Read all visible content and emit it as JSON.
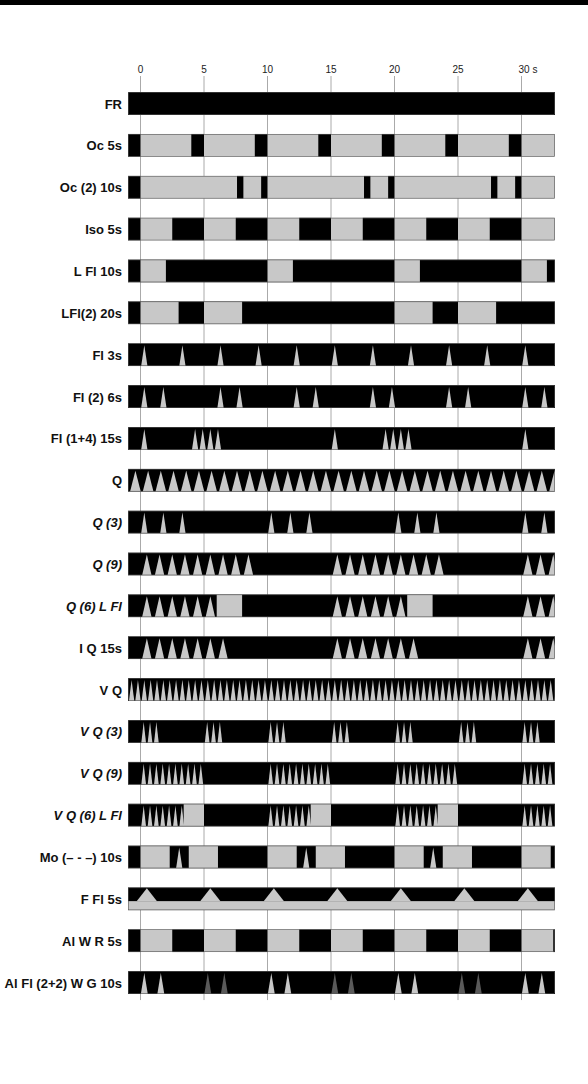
{
  "chart_data": {
    "type": "timeline",
    "title": "",
    "xlabel": "s",
    "xlim": [
      -0.95,
      32.7
    ],
    "x_ticks": [
      0,
      5,
      10,
      15,
      20,
      25,
      30
    ],
    "x_tick_labels": [
      "0",
      "5",
      "10",
      "15",
      "20",
      "25",
      "30 s"
    ],
    "colors": {
      "dark": "#000000",
      "light": "#c8c8c8",
      "dim": "#5a5a5a",
      "grid": "#aaaaaa"
    },
    "rows": [
      {
        "label": "FR",
        "italic": false,
        "base": "dark",
        "segments": [
          {
            "s": -1,
            "e": 33,
            "c": "dark"
          }
        ]
      },
      {
        "label": "Oc 5s",
        "italic": false,
        "base": "light",
        "segments": [
          {
            "s": -1,
            "e": 0,
            "c": "dark"
          },
          {
            "s": 4,
            "e": 5,
            "c": "dark"
          },
          {
            "s": 9,
            "e": 10,
            "c": "dark"
          },
          {
            "s": 14,
            "e": 15,
            "c": "dark"
          },
          {
            "s": 19,
            "e": 20,
            "c": "dark"
          },
          {
            "s": 24,
            "e": 25,
            "c": "dark"
          },
          {
            "s": 29,
            "e": 30,
            "c": "dark"
          }
        ]
      },
      {
        "label": "Oc (2) 10s",
        "italic": false,
        "base": "light",
        "segments": [
          {
            "s": -1,
            "e": 0,
            "c": "dark"
          },
          {
            "s": 7.6,
            "e": 8.1,
            "c": "dark"
          },
          {
            "s": 9.5,
            "e": 10,
            "c": "dark"
          },
          {
            "s": 17.6,
            "e": 18.1,
            "c": "dark"
          },
          {
            "s": 19.5,
            "e": 20,
            "c": "dark"
          },
          {
            "s": 27.6,
            "e": 28.1,
            "c": "dark"
          },
          {
            "s": 29.5,
            "e": 30,
            "c": "dark"
          }
        ]
      },
      {
        "label": "Iso 5s",
        "italic": false,
        "base": "light",
        "segments": [
          {
            "s": -1,
            "e": 0,
            "c": "dark"
          },
          {
            "s": 2.5,
            "e": 5,
            "c": "dark"
          },
          {
            "s": 7.5,
            "e": 10,
            "c": "dark"
          },
          {
            "s": 12.5,
            "e": 15,
            "c": "dark"
          },
          {
            "s": 17.5,
            "e": 20,
            "c": "dark"
          },
          {
            "s": 22.5,
            "e": 25,
            "c": "dark"
          },
          {
            "s": 27.5,
            "e": 30,
            "c": "dark"
          }
        ]
      },
      {
        "label": "L Fl 10s",
        "italic": false,
        "base": "dark",
        "segments": [
          {
            "s": 0,
            "e": 2,
            "c": "light"
          },
          {
            "s": 10,
            "e": 12,
            "c": "light"
          },
          {
            "s": 20,
            "e": 22,
            "c": "light"
          },
          {
            "s": 30,
            "e": 32,
            "c": "light"
          }
        ]
      },
      {
        "label": "LFl(2) 20s",
        "italic": false,
        "base": "dark",
        "segments": [
          {
            "s": 0,
            "e": 3,
            "c": "light"
          },
          {
            "s": 5,
            "e": 8,
            "c": "light"
          },
          {
            "s": 20,
            "e": 23,
            "c": "light"
          },
          {
            "s": 25,
            "e": 28,
            "c": "light"
          }
        ]
      },
      {
        "label": "Fl 3s",
        "italic": false,
        "base": "dark",
        "flashes": [
          0.3,
          3.3,
          6.3,
          9.3,
          12.3,
          15.3,
          18.3,
          21.3,
          24.3,
          27.3,
          30.3
        ],
        "flash_w": 0.5,
        "flash_c": "light"
      },
      {
        "label": "Fl (2) 6s",
        "italic": false,
        "base": "dark",
        "flashes": [
          0.3,
          1.8,
          6.3,
          7.8,
          12.3,
          13.8,
          18.3,
          19.8,
          24.3,
          25.8,
          30.3,
          31.8
        ],
        "flash_w": 0.5,
        "flash_c": "light"
      },
      {
        "label": "Fl (1+4) 15s",
        "italic": false,
        "base": "dark",
        "flashes": [
          0.3,
          4.3,
          4.9,
          5.5,
          6.1,
          15.3,
          19.3,
          19.9,
          20.5,
          21.1,
          30.3
        ],
        "flash_w": 0.5,
        "flash_c": "light"
      },
      {
        "label": "Q",
        "italic": false,
        "base": "dark",
        "pattern": "quick",
        "period": 1.0,
        "flash_w": 0.5,
        "start": -0.9,
        "end": 32.7,
        "flash_c": "light"
      },
      {
        "label": "Q (3)",
        "italic": true,
        "base": "dark",
        "flashes": [
          0.3,
          1.8,
          3.3,
          10.3,
          11.8,
          13.3,
          20.3,
          21.8,
          23.3,
          30.3,
          31.8
        ],
        "flash_w": 0.5,
        "flash_c": "light"
      },
      {
        "label": "Q (9)",
        "italic": true,
        "base": "dark",
        "groups": [
          {
            "start": 0.0,
            "count": 9
          },
          {
            "start": 15.0,
            "count": 9
          },
          {
            "start": 30.0,
            "count": 3
          }
        ],
        "period": 1.0,
        "flash_w": 0.5,
        "flash_c": "light"
      },
      {
        "label": "Q (6) L Fl",
        "italic": true,
        "base": "dark",
        "groups": [
          {
            "start": 0.0,
            "count": 6
          },
          {
            "start": 15.0,
            "count": 6
          },
          {
            "start": 30.0,
            "count": 3
          }
        ],
        "period": 1.0,
        "flash_w": 0.5,
        "flash_c": "light",
        "segments": [
          {
            "s": 6,
            "e": 8,
            "c": "light"
          },
          {
            "s": 21,
            "e": 23,
            "c": "light"
          }
        ]
      },
      {
        "label": "I Q 15s",
        "italic": false,
        "base": "dark",
        "groups": [
          {
            "start": 0.0,
            "count": 7
          },
          {
            "start": 15.0,
            "count": 7
          },
          {
            "start": 30.0,
            "count": 3
          }
        ],
        "period": 1.0,
        "flash_w": 0.5,
        "flash_c": "light"
      },
      {
        "label": "V Q",
        "italic": false,
        "base": "dark",
        "pattern": "quick",
        "period": 0.5,
        "flash_w": 0.25,
        "start": -0.95,
        "end": 32.7,
        "flash_c": "light"
      },
      {
        "label": "V Q (3)",
        "italic": true,
        "base": "dark",
        "groups": [
          {
            "start": 0.0,
            "count": 3
          },
          {
            "start": 5.0,
            "count": 3
          },
          {
            "start": 10.0,
            "count": 3
          },
          {
            "start": 15.0,
            "count": 3
          },
          {
            "start": 20.0,
            "count": 3
          },
          {
            "start": 25.0,
            "count": 3
          },
          {
            "start": 30.0,
            "count": 3
          }
        ],
        "period": 0.5,
        "flash_w": 0.25,
        "flash_c": "light"
      },
      {
        "label": "V Q (9)",
        "italic": true,
        "base": "dark",
        "groups": [
          {
            "start": 0.0,
            "count": 10
          },
          {
            "start": 10.0,
            "count": 10
          },
          {
            "start": 20.0,
            "count": 10
          },
          {
            "start": 30.0,
            "count": 5
          }
        ],
        "period": 0.5,
        "flash_w": 0.25,
        "flash_c": "light"
      },
      {
        "label": "V Q (6) L Fl",
        "italic": true,
        "base": "dark",
        "groups": [
          {
            "start": 0.0,
            "count": 7
          },
          {
            "start": 10.0,
            "count": 7
          },
          {
            "start": 20.0,
            "count": 7
          },
          {
            "start": 30.0,
            "count": 5
          }
        ],
        "period": 0.5,
        "flash_w": 0.25,
        "flash_c": "light",
        "segments": [
          {
            "s": 3.4,
            "e": 5,
            "c": "light"
          },
          {
            "s": 13.4,
            "e": 15,
            "c": "light"
          },
          {
            "s": 23.4,
            "e": 25,
            "c": "light"
          }
        ]
      },
      {
        "label": "Mo (– - –) 10s",
        "italic": false,
        "base": "dark",
        "segments": [
          {
            "s": 0,
            "e": 2.3,
            "c": "light"
          },
          {
            "s": 3.8,
            "e": 6.1,
            "c": "light"
          },
          {
            "s": 10,
            "e": 12.3,
            "c": "light"
          },
          {
            "s": 13.8,
            "e": 16.1,
            "c": "light"
          },
          {
            "s": 20,
            "e": 22.3,
            "c": "light"
          },
          {
            "s": 23.8,
            "e": 26.1,
            "c": "light"
          },
          {
            "s": 30,
            "e": 32.3,
            "c": "light"
          }
        ],
        "flashes": [
          3.05,
          13.05,
          23.05
        ],
        "flash_w": 0.5,
        "flash_c": "light"
      },
      {
        "label": "F Fl 5s",
        "italic": false,
        "base": "dark",
        "pattern": "fixed-flash",
        "bumps": [
          0.5,
          5.5,
          10.5,
          15.5,
          20.5,
          25.5,
          30.5
        ],
        "flash_w": 0.8,
        "flash_c": "light"
      },
      {
        "label": "Al W R 5s",
        "italic": false,
        "base": "light",
        "segments": [
          {
            "s": -1,
            "e": 0,
            "c": "dark"
          },
          {
            "s": 2.5,
            "e": 5,
            "c": "dark"
          },
          {
            "s": 7.5,
            "e": 10,
            "c": "dark"
          },
          {
            "s": 12.5,
            "e": 15,
            "c": "dark"
          },
          {
            "s": 17.5,
            "e": 20,
            "c": "dark"
          },
          {
            "s": 22.5,
            "e": 25,
            "c": "dark"
          },
          {
            "s": 27.5,
            "e": 30,
            "c": "dark"
          },
          {
            "s": 32.5,
            "e": 33,
            "c": "dark"
          }
        ]
      },
      {
        "label": "Al Fl (2+2) W G 10s",
        "italic": false,
        "base": "dark",
        "flashes_colored": [
          {
            "t": 0.3,
            "c": "light"
          },
          {
            "t": 1.6,
            "c": "light"
          },
          {
            "t": 5.3,
            "c": "dim"
          },
          {
            "t": 6.6,
            "c": "dim"
          },
          {
            "t": 10.3,
            "c": "light"
          },
          {
            "t": 11.6,
            "c": "light"
          },
          {
            "t": 15.3,
            "c": "dim"
          },
          {
            "t": 16.6,
            "c": "dim"
          },
          {
            "t": 20.3,
            "c": "light"
          },
          {
            "t": 21.6,
            "c": "light"
          },
          {
            "t": 25.3,
            "c": "dim"
          },
          {
            "t": 26.6,
            "c": "dim"
          },
          {
            "t": 30.3,
            "c": "light"
          },
          {
            "t": 31.6,
            "c": "light"
          }
        ],
        "flash_w": 0.55
      }
    ]
  }
}
